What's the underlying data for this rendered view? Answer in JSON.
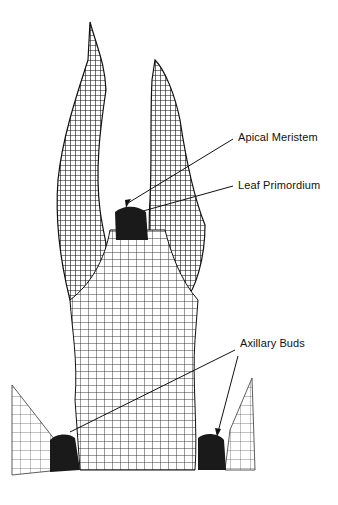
{
  "figure": {
    "labels": {
      "apical_meristem": "Apical Meristem",
      "leaf_primordium": "Leaf Primordium",
      "axillary_buds": "Axillary Buds"
    },
    "colors": {
      "ink": "#111111",
      "background": "#ffffff",
      "tissue_dark": "#1a1a1a"
    }
  }
}
